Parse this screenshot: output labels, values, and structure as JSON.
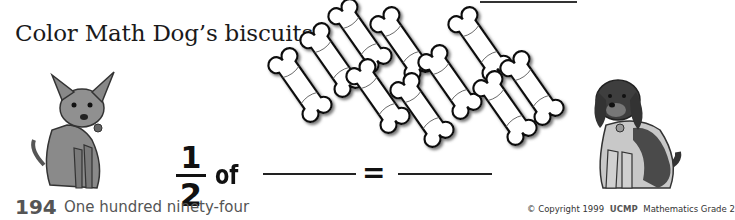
{
  "worksheet": {
    "instruction": "Color Math Dog’s biscuits.",
    "biscuit_count": 11,
    "equation": {
      "numerator": "1",
      "denominator": "2",
      "of_label": "of",
      "equals": "=",
      "blank_1": "",
      "blank_2": ""
    },
    "name_blank": ""
  },
  "footer": {
    "page_number": "194",
    "page_words": "One hundred ninety-four",
    "copyright": "© Copyright 1999",
    "publisher_logo": "UCMP",
    "series": "Mathematics Grade 2"
  },
  "illustrations": {
    "left": "chihuahua-dog",
    "right": "spaniel-dog"
  }
}
